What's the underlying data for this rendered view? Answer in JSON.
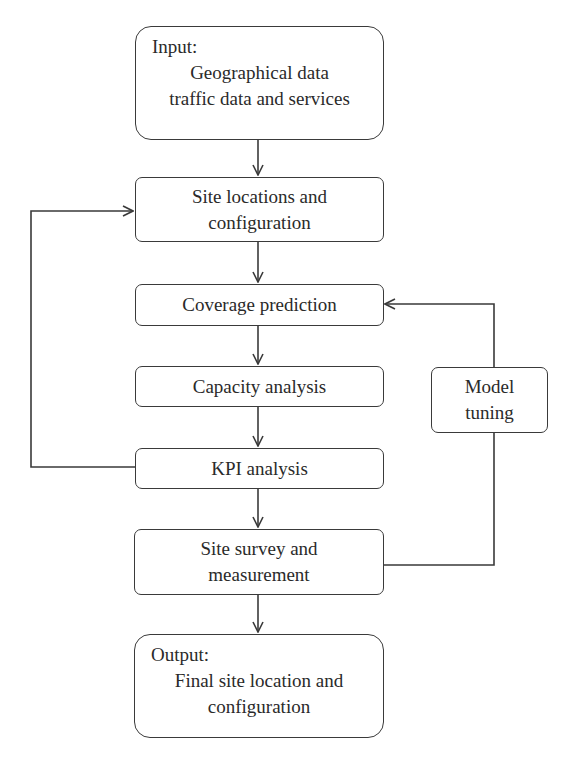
{
  "nodes": {
    "input": {
      "lead": "Input:",
      "line1": "Geographical data",
      "line2": "traffic data and services"
    },
    "site_locations": {
      "line1": "Site locations and",
      "line2": "configuration"
    },
    "coverage": {
      "label": "Coverage prediction"
    },
    "capacity": {
      "label": "Capacity analysis"
    },
    "kpi": {
      "label": "KPI analysis"
    },
    "site_survey": {
      "line1": "Site survey and",
      "line2": "measurement"
    },
    "output": {
      "lead": "Output:",
      "line1": "Final site location and",
      "line2": "configuration"
    },
    "model_tuning": {
      "line1": "Model",
      "line2": "tuning"
    }
  },
  "edges": [
    {
      "from": "input",
      "to": "site_locations"
    },
    {
      "from": "site_locations",
      "to": "coverage"
    },
    {
      "from": "coverage",
      "to": "capacity"
    },
    {
      "from": "capacity",
      "to": "kpi"
    },
    {
      "from": "kpi",
      "to": "site_survey"
    },
    {
      "from": "site_survey",
      "to": "output"
    },
    {
      "from": "kpi",
      "to": "site_locations",
      "type": "feedback-loop-left"
    },
    {
      "from": "site_survey",
      "to": "model_tuning",
      "type": "feedback-line-right"
    },
    {
      "from": "model_tuning",
      "to": "coverage",
      "type": "feedback-loop-right"
    }
  ]
}
